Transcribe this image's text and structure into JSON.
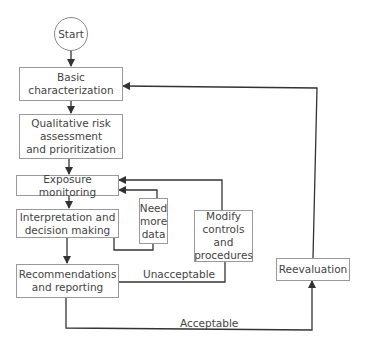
{
  "diagram": {
    "type": "flowchart",
    "nodes": {
      "start": "Start",
      "basic": "Basic\ncharacterization",
      "qualitative": "Qualitative risk\nassessment\nand prioritization",
      "exposure": "Exposure monitoring",
      "interpretation": "Interpretation and\ndecision making",
      "need_data": "Need\nmore\ndata",
      "modify": "Modify\ncontrols\nand\nprocedures",
      "recommendations": "Recommendations\nand reporting",
      "reevaluation": "Reevaluation"
    },
    "edge_labels": {
      "unacceptable": "Unacceptable",
      "acceptable": "Acceptable"
    },
    "edges": [
      {
        "from": "start",
        "to": "basic"
      },
      {
        "from": "basic",
        "to": "qualitative"
      },
      {
        "from": "qualitative",
        "to": "exposure"
      },
      {
        "from": "exposure",
        "to": "interpretation"
      },
      {
        "from": "interpretation",
        "to": "need_data"
      },
      {
        "from": "need_data",
        "to": "exposure"
      },
      {
        "from": "interpretation",
        "to": "recommendations"
      },
      {
        "from": "recommendations",
        "to": "modify",
        "label": "Unacceptable"
      },
      {
        "from": "modify",
        "to": "exposure"
      },
      {
        "from": "recommendations",
        "to": "reevaluation",
        "label": "Acceptable"
      },
      {
        "from": "reevaluation",
        "to": "basic"
      }
    ]
  }
}
